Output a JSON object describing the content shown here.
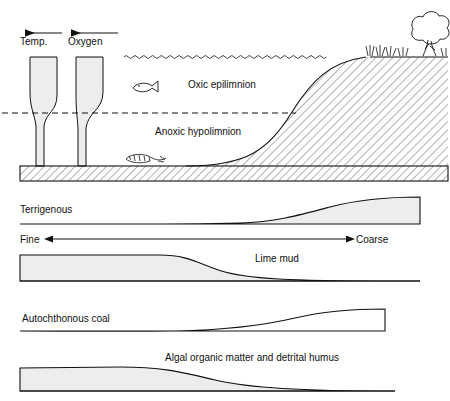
{
  "figure": {
    "title_visible": false,
    "background_color": "#ffffff",
    "line_color": "#111111",
    "wedge_fill_color": "#ededed",
    "hatch_color": "#4a4a4a"
  },
  "lake_panel": {
    "name": "stratified-lake-cross-section",
    "profiles": [
      {
        "id": "temp",
        "label": "Temp.",
        "arrow": "left-arrow-icon",
        "arrow_direction": "left"
      },
      {
        "id": "oxygen",
        "label": "Oxygen",
        "arrow": "left-arrow-icon",
        "arrow_direction": "left"
      }
    ],
    "water_layers": [
      {
        "id": "epilimnion",
        "label": "Oxic epilimnion"
      },
      {
        "id": "hypolimnion",
        "label": "Anoxic hypolimnion"
      }
    ],
    "boundary": {
      "id": "thermocline",
      "style": "dashed"
    },
    "surface": {
      "id": "water-surface",
      "style": "wavy"
    },
    "icons": [
      {
        "name": "fish-icon",
        "meaning": "live fish in oxic epilimnion"
      },
      {
        "name": "dead-fish-icon",
        "meaning": "fish remains on anoxic lake floor"
      },
      {
        "name": "tree-icon",
        "meaning": "shoreline vegetation"
      },
      {
        "name": "grass-icon",
        "meaning": "shoreline grass tufts"
      }
    ],
    "substrate": {
      "id": "lake-floor",
      "fill": "hatched"
    },
    "shore": {
      "id": "shore-slope",
      "fill": "hatched"
    }
  },
  "facies_panels": [
    {
      "id": "terrigenous",
      "label": "Terrigenous",
      "shaded": true,
      "trend": "thin-left-to-thick-right",
      "description": "wedge thickens toward coarse (shoreward) end"
    },
    {
      "id": "lime-mud",
      "label": "Lime mud",
      "shaded": true,
      "trend": "thick-left-to-thin-right",
      "description": "wedge thins toward coarse end"
    },
    {
      "id": "autochthonous-coal",
      "label": "Autochthonous coal",
      "shaded": false,
      "trend": "thin-left-to-thick-right",
      "description": "unfilled wedge thickening shoreward"
    },
    {
      "id": "algal-organic-matter",
      "label": "Algal organic matter and detrital humus",
      "shaded": true,
      "trend": "thick-left-to-thin-right",
      "description": "wedge thins toward coarse end"
    }
  ],
  "grain_size_axis": {
    "name": "grain-size-axis",
    "left_label": "Fine",
    "right_label": "Coarse",
    "arrow_style": "double-headed"
  }
}
